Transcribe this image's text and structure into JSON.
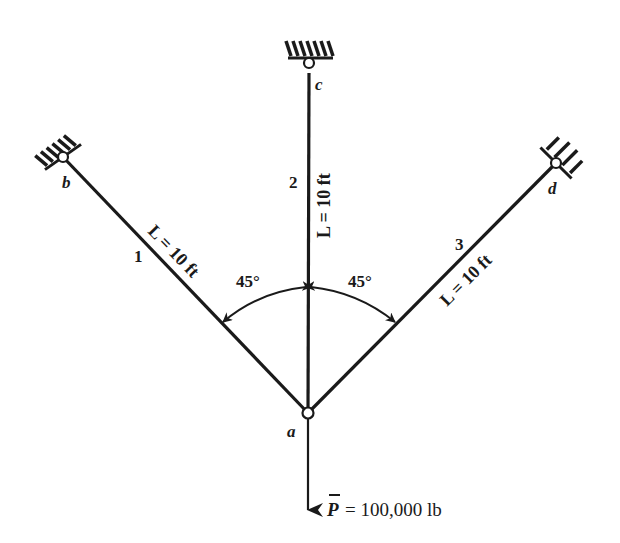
{
  "diagram": {
    "nodes": [
      {
        "id": "a",
        "label": "a",
        "role": "load-point"
      },
      {
        "id": "b",
        "label": "b",
        "role": "fixed-support"
      },
      {
        "id": "c",
        "label": "c",
        "role": "fixed-support"
      },
      {
        "id": "d",
        "label": "d",
        "role": "fixed-support"
      }
    ],
    "members": [
      {
        "number": "1",
        "from": "a",
        "to": "b",
        "length_label": "L = 10 ft"
      },
      {
        "number": "2",
        "from": "a",
        "to": "c",
        "length_label": "L = 10 ft"
      },
      {
        "number": "3",
        "from": "a",
        "to": "d",
        "length_label": "L = 10 ft"
      }
    ],
    "angles": [
      {
        "label": "45°",
        "between": [
          "1",
          "2"
        ]
      },
      {
        "label": "45°",
        "between": [
          "2",
          "3"
        ]
      }
    ],
    "load": {
      "symbol": "P",
      "value_label": "= 100,000 lb",
      "direction": "down"
    },
    "colors": {
      "ink": "#1a1a1a",
      "background": "#ffffff"
    }
  }
}
